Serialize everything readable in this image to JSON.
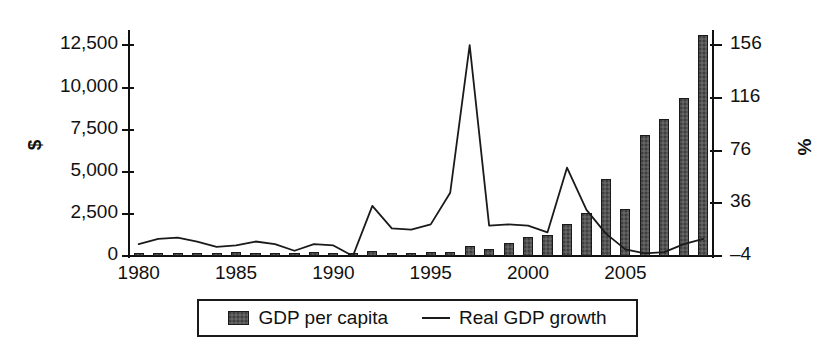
{
  "chart_data": {
    "type": "bar",
    "title": "",
    "xlabel": "",
    "ylabel": "$",
    "ylabel_right": "%",
    "grid": false,
    "legend_position": "bottom",
    "x": [
      1980,
      1981,
      1982,
      1983,
      1984,
      1985,
      1986,
      1987,
      1988,
      1989,
      1990,
      1991,
      1992,
      1993,
      1994,
      1995,
      1996,
      1997,
      1998,
      1999,
      2000,
      2001,
      2002,
      2003,
      2004,
      2005,
      2006,
      2007,
      2008,
      2009
    ],
    "xticks": [
      1980,
      1985,
      1990,
      1995,
      2000,
      2005
    ],
    "xtick_labels": [
      "1980",
      "1985",
      "1990",
      "1995",
      "2000",
      "2005"
    ],
    "yticks_left": [
      0,
      2500,
      5000,
      7500,
      10000,
      12500
    ],
    "ytick_labels_left": [
      "0",
      "2,500",
      "5,000",
      "7,500",
      "10,000",
      "12,500"
    ],
    "ylim_left": [
      0,
      13300
    ],
    "yticks_right": [
      -4,
      36,
      76,
      116,
      156
    ],
    "ytick_labels_right": [
      "–4",
      "36",
      "76",
      "116",
      "156"
    ],
    "ylim_right": [
      -4,
      166
    ],
    "series": [
      {
        "name": "GDP per capita",
        "type": "bar",
        "axis": "left",
        "unit": "$",
        "color": "#555555",
        "edge_color": "#1a1a1a",
        "values": [
          170,
          180,
          190,
          200,
          170,
          230,
          150,
          170,
          200,
          210,
          160,
          150,
          320,
          200,
          190,
          210,
          240,
          600,
          420,
          800,
          1150,
          1250,
          1900,
          2550,
          4600,
          2800,
          7200,
          8150,
          9400,
          13100
        ]
      },
      {
        "name": "Real GDP growth",
        "type": "line",
        "axis": "right",
        "unit": "%",
        "color": "#1a1a1a",
        "values": [
          5,
          9,
          10,
          7,
          3,
          4,
          7,
          5,
          0,
          5,
          4,
          -4,
          34,
          17,
          16,
          20,
          44,
          156,
          19,
          20,
          19,
          14,
          63,
          31,
          13,
          1,
          -2,
          -1,
          5,
          9
        ]
      }
    ],
    "legend": [
      {
        "label": "GDP per capita",
        "marker": "bar-swatch"
      },
      {
        "label": "Real GDP growth",
        "marker": "line-swatch"
      }
    ]
  }
}
